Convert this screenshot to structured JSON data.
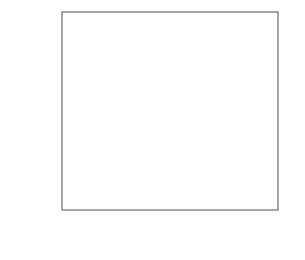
{
  "chart_data": {
    "type": "scatter",
    "title": "",
    "xlabel": "Mole fraction 2H",
    "xlabel_base": "Mole fraction ",
    "xlabel_sup": "2",
    "xlabel_tail": "H",
    "ylabel": "kH/kL",
    "ylabel_k1": "k",
    "ylabel_sub1": "H",
    "ylabel_slash": "/k",
    "ylabel_sub2": "L",
    "xlim": [
      -0.08,
      1.08
    ],
    "ylim": [
      0.8,
      2.3
    ],
    "xticks": [
      0,
      0.2,
      0.4,
      0.6,
      0.8,
      1.0
    ],
    "xticklabels": [
      "0",
      "0.2",
      "0.4",
      "0.6",
      "0.8",
      "1.0"
    ],
    "yticks": [
      0.8,
      1.0,
      1.2,
      1.4,
      1.6,
      1.8,
      2.0,
      2.2
    ],
    "yticklabels": [
      "0.8",
      "1.0",
      "1.2",
      "1.4",
      "1.6",
      "1.8",
      "2.0",
      "2.2"
    ],
    "x_minor_step": 0.05,
    "y_minor_step": 0.05,
    "grid": false,
    "legend": "none",
    "frame": true,
    "series": [
      {
        "name": "circles",
        "marker": "filled-circle",
        "x": [
          0.0,
          0.2,
          0.4,
          0.6,
          0.8,
          1.0
        ],
        "values": [
          1.005,
          1.12,
          1.25,
          1.415,
          1.575,
          1.885
        ],
        "yerr": [
          0.05,
          0.065,
          0.07,
          0.055,
          0.05,
          0.065
        ],
        "fit_line": {
          "x0": 0.0,
          "y0": 0.955,
          "x1": 1.0,
          "y1": 1.82
        }
      },
      {
        "name": "triangles",
        "marker": "filled-triangle",
        "x": [
          0.2,
          0.4,
          0.6,
          0.8,
          1.0
        ],
        "values": [
          1.095,
          1.025,
          1.075,
          1.12,
          1.085
        ],
        "yerr": [
          0.04,
          0.04,
          0.04,
          0.045,
          0.04
        ],
        "fit_line": {
          "x0": 0.0,
          "y0": 1.068,
          "x1": 1.0,
          "y1": 1.08
        }
      }
    ]
  },
  "colors": {
    "axis": "#4d4d4d",
    "marker": "#000000",
    "fitline": "#555555",
    "background": "#ffffff"
  }
}
